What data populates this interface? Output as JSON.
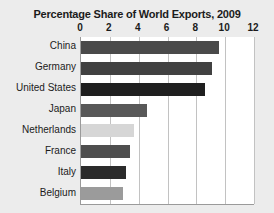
{
  "chart_data": {
    "type": "bar",
    "orientation": "horizontal",
    "title": "Percentage Share of World Exports, 2009",
    "xlabel": "",
    "ylabel": "",
    "xlim": [
      0,
      12
    ],
    "xticks": [
      0,
      2,
      4,
      6,
      8,
      10,
      12
    ],
    "xtick_labels": [
      "0",
      "2",
      "4",
      "6",
      "8",
      "10",
      "12"
    ],
    "grid": "vertical",
    "legend": "none",
    "categories": [
      "China",
      "Germany",
      "United States",
      "Japan",
      "Netherlands",
      "France",
      "Italy",
      "Belgium"
    ],
    "values": [
      9.6,
      9.1,
      8.6,
      4.6,
      3.7,
      3.4,
      3.1,
      2.9
    ],
    "bar_colors": [
      "#4a4a4a",
      "#414141",
      "#1f1f1f",
      "#585858",
      "#d6d6d6",
      "#4e4e4e",
      "#2b2b2b",
      "#9b9b9b"
    ],
    "bars": [
      {
        "label": "China",
        "value": 9.6,
        "color": "#4a4a4a"
      },
      {
        "label": "Germany",
        "value": 9.1,
        "color": "#414141"
      },
      {
        "label": "United States",
        "value": 8.6,
        "color": "#1f1f1f"
      },
      {
        "label": "Japan",
        "value": 4.6,
        "color": "#585858"
      },
      {
        "label": "Netherlands",
        "value": 3.7,
        "color": "#d6d6d6"
      },
      {
        "label": "France",
        "value": 3.4,
        "color": "#4e4e4e"
      },
      {
        "label": "Italy",
        "value": 3.1,
        "color": "#2b2b2b"
      },
      {
        "label": "Belgium",
        "value": 2.9,
        "color": "#9b9b9b"
      }
    ]
  },
  "style": {
    "figure_background": "#ececec",
    "plot_background": "#ffffff",
    "gridline_color": "#c2c2c2",
    "axis_color": "#9a9a9a",
    "text_color": "#1b1b1b"
  }
}
